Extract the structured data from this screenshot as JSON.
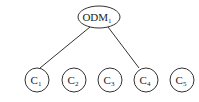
{
  "diagram": {
    "type": "tree",
    "root": {
      "label": "ODM",
      "subscript": "1"
    },
    "children": [
      {
        "label": "C",
        "subscript": "1",
        "connected": true
      },
      {
        "label": "C",
        "subscript": "2",
        "connected": false
      },
      {
        "label": "C",
        "subscript": "3",
        "connected": false
      },
      {
        "label": "C",
        "subscript": "4",
        "connected": true
      },
      {
        "label": "C",
        "subscript": "5",
        "connected": false
      }
    ],
    "edges": [
      [
        "ODM1",
        "C1"
      ],
      [
        "ODM1",
        "C4"
      ]
    ],
    "colors": {
      "stroke": "#333333",
      "background": "#ffffff"
    }
  }
}
